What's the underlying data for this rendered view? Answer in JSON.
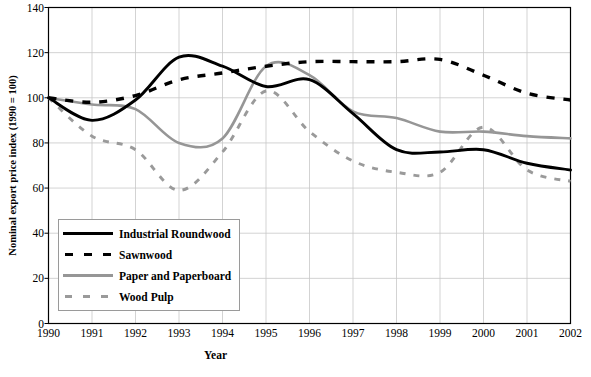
{
  "chart_data": {
    "type": "line",
    "title": "",
    "xlabel": "Year",
    "ylabel": "Nominal export price index (1990 = 100)",
    "x": [
      1990,
      1991,
      1992,
      1993,
      1994,
      1995,
      1996,
      1997,
      1998,
      1999,
      2000,
      2001,
      2002
    ],
    "xticklabels": [
      "1990",
      "1991",
      "1992",
      "1993",
      "1994",
      "1995",
      "1996",
      "1997",
      "1998",
      "1999",
      "2000",
      "2001",
      "2002"
    ],
    "yticklabels": [
      "0",
      "20",
      "40",
      "60",
      "80",
      "100",
      "120",
      "140"
    ],
    "yticks": [
      0,
      20,
      40,
      60,
      80,
      100,
      120,
      140
    ],
    "xlim": [
      1990,
      2002
    ],
    "ylim": [
      0,
      140
    ],
    "grid": true,
    "legend_position": "lower-left-inside",
    "series": [
      {
        "name": "Industrial Roundwood",
        "style": "solid",
        "color": "#000000",
        "values": [
          100,
          90,
          99,
          118,
          114,
          105,
          108,
          93,
          77,
          76,
          77,
          71,
          68
        ]
      },
      {
        "name": "Sawnwood",
        "style": "dashed",
        "color": "#000000",
        "values": [
          100,
          98,
          101,
          108,
          111,
          114,
          116,
          116,
          116,
          117,
          110,
          102,
          99
        ]
      },
      {
        "name": "Paper and Paperboard",
        "style": "solid",
        "color": "#969696",
        "values": [
          100,
          97,
          95,
          80,
          82,
          114,
          110,
          94,
          91,
          85,
          85,
          83,
          82
        ]
      },
      {
        "name": "Wood Pulp",
        "style": "dashed",
        "color": "#9a9a9a",
        "values": [
          100,
          83,
          77,
          59,
          76,
          103,
          85,
          72,
          67,
          67,
          87,
          68,
          63
        ]
      }
    ]
  },
  "legend": {
    "items": [
      {
        "label": "Industrial Roundwood",
        "key": "solid-black"
      },
      {
        "label": "Sawnwood",
        "key": "dash-black"
      },
      {
        "label": "Paper and Paperboard",
        "key": "solid-gray"
      },
      {
        "label": "Wood Pulp",
        "key": "dash-gray"
      }
    ]
  },
  "axes": {
    "frame_color": "#000000",
    "grid_color": "#c8c8c8"
  }
}
